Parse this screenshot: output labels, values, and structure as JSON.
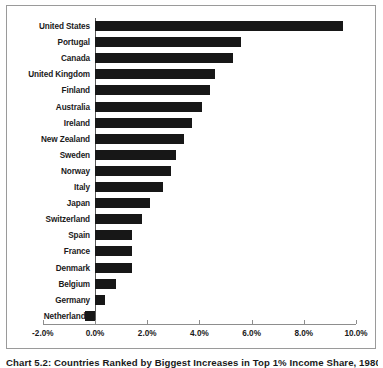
{
  "chart_data": {
    "type": "bar",
    "orientation": "horizontal",
    "title": "Chart 5.2: Countries Ranked by Biggest Increases in Top 1% Income Share, 1980-2007",
    "xlabel": "",
    "ylabel": "",
    "xlim": [
      -2.0,
      10.0
    ],
    "xticks": [
      -2.0,
      0.0,
      2.0,
      4.0,
      6.0,
      8.0,
      10.0
    ],
    "xtick_labels": [
      "-2.0%",
      "0.0%",
      "2.0%",
      "4.0%",
      "6.0%",
      "8.0%",
      "10.0%"
    ],
    "grid": false,
    "legend": null,
    "bar_color": "#171717",
    "categories": [
      "United States",
      "Portugal",
      "Canada",
      "United Kingdom",
      "Finland",
      "Australia",
      "Ireland",
      "New Zealand",
      "Sweden",
      "Norway",
      "Italy",
      "Japan",
      "Switzerland",
      "Spain",
      "France",
      "Denmark",
      "Belgium",
      "Germany",
      "Netherlands"
    ],
    "values": [
      9.5,
      5.6,
      5.3,
      4.6,
      4.4,
      4.1,
      3.7,
      3.4,
      3.1,
      2.9,
      2.6,
      2.1,
      1.8,
      1.4,
      1.4,
      1.4,
      0.8,
      0.4,
      -0.4
    ]
  },
  "caption": {
    "text": "Chart 5.2: Countries Ranked by Biggest Increases in Top 1% Income Share, 1980-2007"
  }
}
